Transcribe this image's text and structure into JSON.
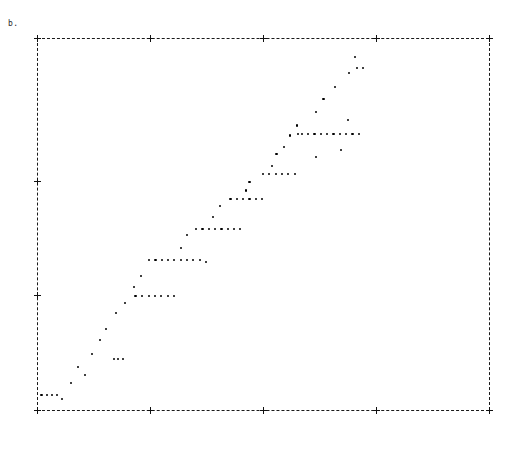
{
  "figure": {
    "panel_label": "b.",
    "background_color": "#ffffff",
    "frame_color": "#1a1a1a",
    "marker_color": "#000000"
  },
  "chart_data": {
    "type": "scatter",
    "title": "b.",
    "xlabel": "",
    "ylabel": "",
    "xlim": [
      0,
      1.0
    ],
    "ylim": [
      0,
      1.0
    ],
    "grid": false,
    "legend": null,
    "frame_style": "dashed",
    "xticks": [
      0,
      0.25,
      0.5,
      0.75,
      1.0
    ],
    "xtick_labels": [
      "0",
      "0.25",
      "0.5",
      "0.75",
      ""
    ],
    "yticks": [
      0.0,
      0.307,
      0.613,
      1.0
    ],
    "ytick_labels": [
      "",
      "",
      "",
      ""
    ],
    "points": [
      [
        0.01,
        0.04
      ],
      [
        0.022,
        0.04
      ],
      [
        0.033,
        0.04
      ],
      [
        0.044,
        0.04
      ],
      [
        0.055,
        0.03
      ],
      [
        0.075,
        0.072
      ],
      [
        0.09,
        0.116
      ],
      [
        0.107,
        0.094
      ],
      [
        0.122,
        0.151
      ],
      [
        0.14,
        0.188
      ],
      [
        0.152,
        0.218
      ],
      [
        0.17,
        0.138
      ],
      [
        0.18,
        0.138
      ],
      [
        0.19,
        0.138
      ],
      [
        0.175,
        0.26
      ],
      [
        0.195,
        0.288
      ],
      [
        0.218,
        0.307
      ],
      [
        0.232,
        0.307
      ],
      [
        0.247,
        0.307
      ],
      [
        0.261,
        0.307
      ],
      [
        0.275,
        0.307
      ],
      [
        0.29,
        0.307
      ],
      [
        0.304,
        0.307
      ],
      [
        0.215,
        0.33
      ],
      [
        0.23,
        0.36
      ],
      [
        0.248,
        0.404
      ],
      [
        0.262,
        0.404
      ],
      [
        0.276,
        0.404
      ],
      [
        0.29,
        0.404
      ],
      [
        0.304,
        0.404
      ],
      [
        0.318,
        0.404
      ],
      [
        0.332,
        0.404
      ],
      [
        0.346,
        0.404
      ],
      [
        0.36,
        0.404
      ],
      [
        0.374,
        0.398
      ],
      [
        0.318,
        0.435
      ],
      [
        0.332,
        0.47
      ],
      [
        0.352,
        0.487
      ],
      [
        0.366,
        0.487
      ],
      [
        0.38,
        0.487
      ],
      [
        0.394,
        0.487
      ],
      [
        0.408,
        0.487
      ],
      [
        0.422,
        0.487
      ],
      [
        0.436,
        0.487
      ],
      [
        0.45,
        0.487
      ],
      [
        0.39,
        0.518
      ],
      [
        0.404,
        0.548
      ],
      [
        0.428,
        0.567
      ],
      [
        0.442,
        0.567
      ],
      [
        0.456,
        0.567
      ],
      [
        0.47,
        0.567
      ],
      [
        0.484,
        0.567
      ],
      [
        0.498,
        0.567
      ],
      [
        0.463,
        0.59
      ],
      [
        0.47,
        0.613
      ],
      [
        0.5,
        0.635
      ],
      [
        0.514,
        0.635
      ],
      [
        0.528,
        0.635
      ],
      [
        0.542,
        0.635
      ],
      [
        0.556,
        0.635
      ],
      [
        0.57,
        0.635
      ],
      [
        0.52,
        0.655
      ],
      [
        0.53,
        0.688
      ],
      [
        0.546,
        0.708
      ],
      [
        0.56,
        0.738
      ],
      [
        0.578,
        0.742
      ],
      [
        0.586,
        0.742
      ],
      [
        0.6,
        0.742
      ],
      [
        0.614,
        0.742
      ],
      [
        0.628,
        0.742
      ],
      [
        0.642,
        0.742
      ],
      [
        0.656,
        0.742
      ],
      [
        0.67,
        0.742
      ],
      [
        0.684,
        0.742
      ],
      [
        0.698,
        0.742
      ],
      [
        0.712,
        0.742
      ],
      [
        0.576,
        0.765
      ],
      [
        0.618,
        0.68
      ],
      [
        0.618,
        0.8
      ],
      [
        0.634,
        0.836
      ],
      [
        0.672,
        0.7
      ],
      [
        0.688,
        0.78
      ],
      [
        0.66,
        0.868
      ],
      [
        0.69,
        0.905
      ],
      [
        0.708,
        0.92
      ],
      [
        0.722,
        0.92
      ],
      [
        0.704,
        0.948
      ]
    ]
  }
}
